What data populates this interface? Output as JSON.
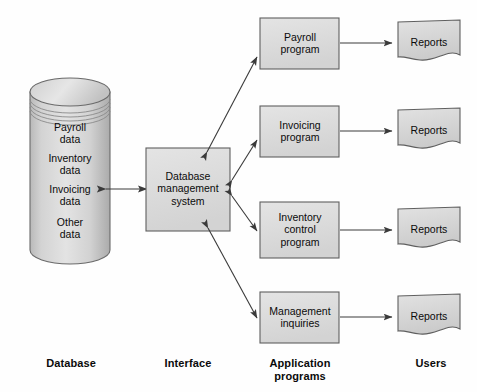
{
  "diagram": {
    "background_color": "#fefefe",
    "shape_fill": "#d9d9d9",
    "shape_stroke": "#555555",
    "arrow_color": "#3a3a3a",
    "text_color": "#0b0b0b"
  },
  "database": {
    "shape": "cylinder",
    "items": [
      {
        "label": "Payroll\ndata"
      },
      {
        "label": "Inventory\ndata"
      },
      {
        "label": "Invoicing\ndata"
      },
      {
        "label": "Other\ndata"
      }
    ]
  },
  "interface": {
    "shape": "rectangle",
    "label": "Database\nmanagement\nsystem"
  },
  "programs": [
    {
      "label": "Payroll\nprogram",
      "output": "Reports"
    },
    {
      "label": "Invoicing\nprogram",
      "output": "Reports"
    },
    {
      "label": "Inventory\ncontrol\nprogram",
      "output": "Reports"
    },
    {
      "label": "Management\ninquiries",
      "output": "Reports"
    }
  ],
  "reports": [
    {
      "label": "Reports"
    },
    {
      "label": "Reports"
    },
    {
      "label": "Reports"
    },
    {
      "label": "Reports"
    }
  ],
  "column_labels": [
    {
      "label": "Database"
    },
    {
      "label": "Interface"
    },
    {
      "label": "Application\nprograms"
    },
    {
      "label": "Users"
    }
  ]
}
